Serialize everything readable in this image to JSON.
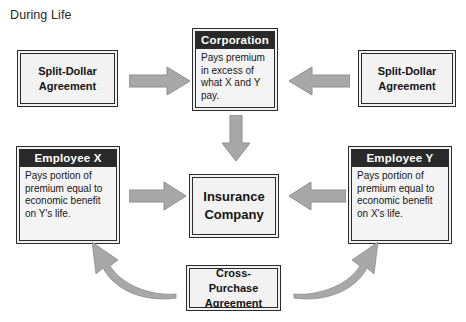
{
  "diagram": {
    "title": "During Life",
    "type": "flow-diagram",
    "colors": {
      "header_bar": "#292929",
      "box_fill": "#f2f2f2",
      "box_body_fill": "#f4f4f4",
      "arrow_fill": "#a8a8a8",
      "arrow_stroke": "#8a8a8a",
      "text": "#141414",
      "header_text": "#ffffff",
      "background": "#ffffff"
    },
    "nodes": [
      {
        "id": "split-dollar-left",
        "kind": "plain",
        "label": "Split-Dollar\nAgreement",
        "line1": "Split-Dollar",
        "line2": "Agreement"
      },
      {
        "id": "corporation",
        "kind": "titled",
        "header": "Corporation",
        "body": "Pays premium in excess of what X and Y pay."
      },
      {
        "id": "split-dollar-right",
        "kind": "plain",
        "label": "Split-Dollar\nAgreement",
        "line1": "Split-Dollar",
        "line2": "Agreement"
      },
      {
        "id": "employee-x",
        "kind": "titled",
        "header": "Employee X",
        "body": "Pays portion of premium equal to economic benefit on Y's life."
      },
      {
        "id": "insurance-company",
        "kind": "plain",
        "label": "Insurance\nCompany",
        "line1": "Insurance",
        "line2": "Company"
      },
      {
        "id": "employee-y",
        "kind": "titled",
        "header": "Employee Y",
        "body": "Pays portion of premium equal to economic benefit on X's life."
      },
      {
        "id": "cross-purchase",
        "kind": "plain",
        "label": "Cross-Purchase\nAgreement",
        "line1": "Cross-Purchase",
        "line2": "Agreement"
      }
    ],
    "edges": [
      {
        "id": "e1",
        "from": "split-dollar-left",
        "to": "corporation",
        "style": "block-arrow",
        "direction": "right"
      },
      {
        "id": "e2",
        "from": "split-dollar-right",
        "to": "corporation",
        "style": "block-arrow",
        "direction": "left"
      },
      {
        "id": "e3",
        "from": "corporation",
        "to": "insurance-company",
        "style": "block-arrow",
        "direction": "down"
      },
      {
        "id": "e4",
        "from": "employee-x",
        "to": "insurance-company",
        "style": "block-arrow",
        "direction": "right"
      },
      {
        "id": "e5",
        "from": "employee-y",
        "to": "insurance-company",
        "style": "block-arrow",
        "direction": "left"
      },
      {
        "id": "e6",
        "from": "cross-purchase",
        "to": "employee-x",
        "style": "curved-arrow",
        "direction": "up-left"
      },
      {
        "id": "e7",
        "from": "cross-purchase",
        "to": "employee-y",
        "style": "curved-arrow",
        "direction": "up-right"
      }
    ]
  }
}
